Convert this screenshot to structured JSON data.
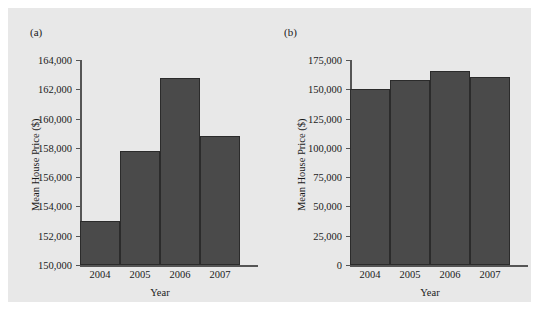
{
  "figure": {
    "background_color": "#e8e8e8",
    "bar_color": "#4a4a4a",
    "axis_color": "#555555"
  },
  "chart_data": [
    {
      "type": "bar",
      "panel_label": "(a)",
      "title": "",
      "xlabel": "Year",
      "ylabel": "Mean House Price ($)",
      "categories": [
        "2004",
        "2005",
        "2006",
        "2007"
      ],
      "values": [
        153000,
        157800,
        162800,
        158800
      ],
      "ylim": [
        150000,
        164000
      ],
      "yticks": [
        150000,
        152000,
        154000,
        156000,
        158000,
        160000,
        162000,
        164000
      ],
      "ytick_labels": [
        "150,000",
        "152,000",
        "154,000",
        "156,000",
        "158,000",
        "160,000",
        "162,000",
        "164,000"
      ],
      "grid": false,
      "legend": "none"
    },
    {
      "type": "bar",
      "panel_label": "(b)",
      "title": "",
      "xlabel": "Year",
      "ylabel": "Mean House Price ($)",
      "categories": [
        "2004",
        "2005",
        "2006",
        "2007"
      ],
      "values": [
        150000,
        157800,
        166000,
        160500
      ],
      "ylim": [
        0,
        175000
      ],
      "yticks": [
        0,
        25000,
        50000,
        75000,
        100000,
        125000,
        150000,
        175000
      ],
      "ytick_labels": [
        "0",
        "25,000",
        "50,000",
        "75,000",
        "100,000",
        "125,000",
        "150,000",
        "175,000"
      ],
      "grid": false,
      "legend": "none"
    }
  ]
}
